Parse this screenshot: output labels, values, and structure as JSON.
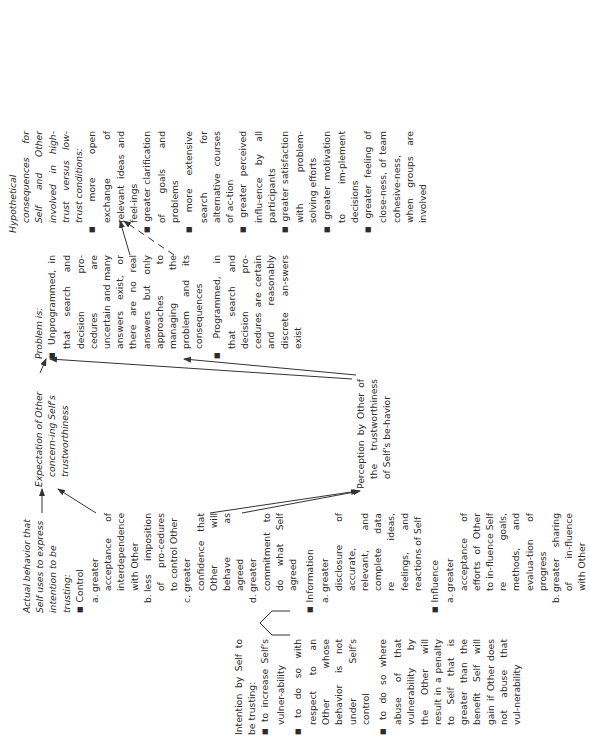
{
  "orientation": "rotated-90-ccw",
  "intention": {
    "title": "Intention by Self to be trusting:",
    "items": [
      "to increase Self's vulner-ability",
      "to do so with respect to an Other whose behavior is not under Self's control",
      "to do so where abuse of that vulnerability by the Other will result in a penalty to Self that is greater than the benefit Self will gain if Other does not abuse that vul-nerability"
    ]
  },
  "actual_behavior": {
    "title": "Actual behavior that Self uses to express intention to be trusting:",
    "groups": [
      {
        "heading": "Control",
        "items": [
          {
            "label": "a.",
            "text": "greater acceptance of interdependence with Other"
          },
          {
            "label": "b.",
            "text": "less imposition of pro-cedures to control Other"
          },
          {
            "label": "c.",
            "text": "greater confidence that Other will behave as agreed"
          },
          {
            "label": "d.",
            "text": "greater commitment to do what Self agreed"
          }
        ]
      },
      {
        "heading": "Information",
        "items": [
          {
            "label": "a.",
            "text": "greater disclosure of accurate, relevant, and complete data re ideas, feelings, and reactions of Self"
          }
        ]
      },
      {
        "heading": "Influence",
        "items": [
          {
            "label": "a.",
            "text": "greater acceptance of efforts of Other to in-fluence Self re goals, methods, and evalua-tion of progress"
          },
          {
            "label": "b.",
            "text": "greater sharing of in-fluence with Other"
          }
        ]
      }
    ]
  },
  "expectation": {
    "title": "Expectation of Other concern-ing Self's trustworthiness"
  },
  "perception": {
    "title": "Perception by Other of the trustworthiness of Self's be-havior"
  },
  "problem": {
    "title": "Problem is:",
    "items": [
      {
        "lead": "Unprogrammed,",
        "text": "in that search and decision pro-cedures are uncertain and many answers exist, or there are no real answers but only approaches to managing the problem and its consequences"
      },
      {
        "lead": "Programmed,",
        "text": "in that search and decision pro-cedures are certain and reasonably discrete an-swers exist"
      }
    ]
  },
  "consequences": {
    "title": "Hypothetical consequences for Self and Other involved in high-trust versus low-trust conditions:",
    "items": [
      "more open exchange of relevant ideas and feel-ings",
      "greater clarification of goals and problems",
      "more extensive search for alternative courses of ac-tion",
      "greater perceived influ-ence by all participants",
      "greater satisfaction with problem-solving efforts",
      "greater motivation to im-plement decisions",
      "greater feeling of close-ness, of team cohesive-ness, when groups are involved"
    ]
  },
  "colors": {
    "text": "#2b2b2b",
    "lines": "#333333",
    "background": "#ffffff"
  }
}
